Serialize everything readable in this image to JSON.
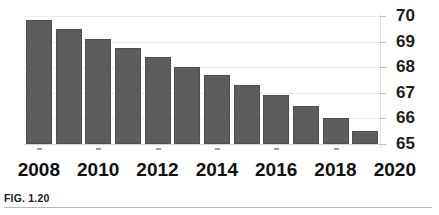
{
  "figure": {
    "caption": "FIG. 1.20"
  },
  "chart_data": {
    "type": "bar",
    "title": "",
    "xlabel": "",
    "ylabel": "",
    "ylim": [
      65,
      70
    ],
    "yticks": [
      65,
      66,
      67,
      68,
      69,
      70
    ],
    "ytick_labels": [
      "65",
      "66",
      "67",
      "68",
      "69",
      "70"
    ],
    "grid": true,
    "legend": null,
    "bar_color": "#5c5c5c",
    "categories": [
      2008,
      2009,
      2010,
      2011,
      2012,
      2013,
      2014,
      2015,
      2016,
      2017,
      2018,
      2019
    ],
    "xtick_labels": [
      "2008",
      "2010",
      "2012",
      "2014",
      "2016",
      "2018",
      "2020"
    ],
    "values": [
      69.85,
      69.5,
      69.1,
      68.75,
      68.4,
      68.0,
      67.7,
      67.3,
      66.9,
      66.5,
      66.0,
      65.5
    ]
  }
}
